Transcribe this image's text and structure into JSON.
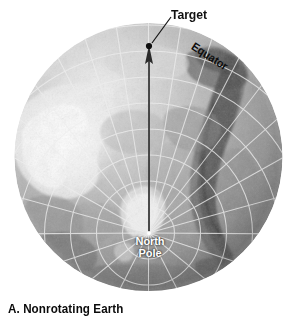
{
  "figure": {
    "caption": "A. Nonrotating Earth",
    "background_color": "#ffffff",
    "ink_color": "#111111",
    "globe": {
      "projection": "north-polar orthographic",
      "center_x": 148,
      "center_y": 157,
      "radius": 134,
      "graticule_color": "#e8e8e8",
      "ocean_tone": "#9a9a9a",
      "land_tone": "#b4b4b4",
      "highlight_tone": "#f2f2f2",
      "shadow_tone": "#5a5a5a",
      "latitude_circles": [
        15,
        30,
        45,
        60,
        75,
        90,
        105,
        120,
        134
      ],
      "meridian_count": 24
    },
    "labels": {
      "target": "Target",
      "equator": "Equator",
      "north_pole_line1": "North",
      "north_pole_line2": "Pole"
    },
    "markers": {
      "target_point": {
        "x": 149,
        "y": 46
      },
      "pole_point": {
        "x": 149,
        "y": 233
      },
      "leader_line": {
        "x1": 160,
        "y1": 42,
        "x2": 172,
        "y2": 16
      }
    },
    "arrow": {
      "from_x": 149,
      "from_y": 233,
      "to_x": 149,
      "to_y": 48,
      "color": "#2a2a2a",
      "head_width": 9,
      "head_length": 18
    }
  }
}
